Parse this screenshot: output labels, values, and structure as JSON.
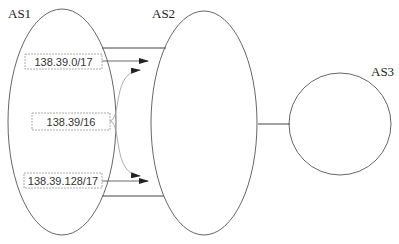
{
  "diagram": {
    "type": "BGP route aggregation across autonomous systems",
    "nodes": [
      {
        "id": "as1",
        "label": "AS1"
      },
      {
        "id": "as2",
        "label": "AS2"
      },
      {
        "id": "as3",
        "label": "AS3"
      }
    ],
    "prefixes": [
      {
        "id": "p1",
        "label": "138.39.0/17"
      },
      {
        "id": "p2",
        "label": "138.39/16"
      },
      {
        "id": "p3",
        "label": "138.39.128/17"
      }
    ],
    "links": [
      {
        "from": "as1",
        "to": "as2",
        "position": "upper"
      },
      {
        "from": "as1",
        "to": "as2",
        "position": "lower"
      },
      {
        "from": "as2",
        "to": "as3"
      }
    ],
    "advertisements": [
      {
        "prefix": "138.39.0/17",
        "to": "as2",
        "path": "upper-link"
      },
      {
        "prefix": "138.39.128/17",
        "to": "as2",
        "path": "lower-link"
      },
      {
        "prefix": "138.39/16",
        "to": "as2",
        "path": "upper-link"
      },
      {
        "prefix": "138.39/16",
        "to": "as2",
        "path": "lower-link"
      }
    ]
  }
}
